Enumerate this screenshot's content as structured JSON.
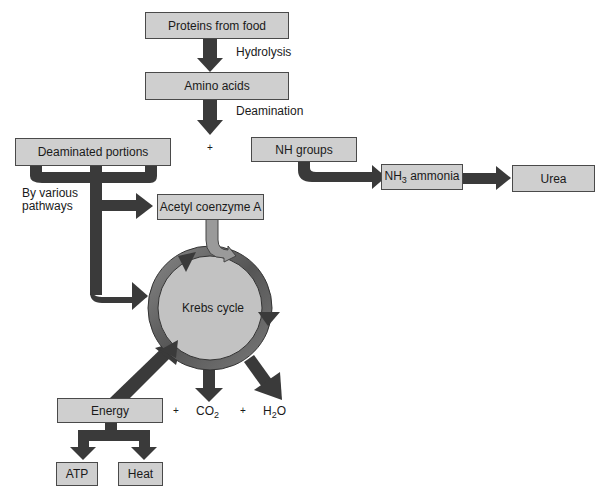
{
  "diagram": {
    "nodes": {
      "proteins": "Proteins from food",
      "amino_acids": "Amino acids",
      "deaminated": "Deaminated portions",
      "nh_groups": "NH groups",
      "nh3_prefix": "NH",
      "nh3_sub": "3",
      "nh3_suffix": " ammonia",
      "urea": "Urea",
      "acetyl": "Acetyl coenzyme A",
      "krebs": "Krebs cycle",
      "energy": "Energy",
      "atp": "ATP",
      "heat": "Heat"
    },
    "labels": {
      "hydrolysis": "Hydrolysis",
      "deamination": "Deamination",
      "plus1": "+",
      "by_various_1": "By various",
      "by_various_2": "pathways",
      "plus2": "+",
      "co2_prefix": "CO",
      "co2_sub": "2",
      "plus3": "+",
      "h2o_prefix": "H",
      "h2o_sub": "2",
      "h2o_suffix": "O"
    },
    "colors": {
      "box_fill": "#cfcfcf",
      "arrow": "#3a3a3a",
      "circle_fill": "#c2c2c2"
    }
  }
}
